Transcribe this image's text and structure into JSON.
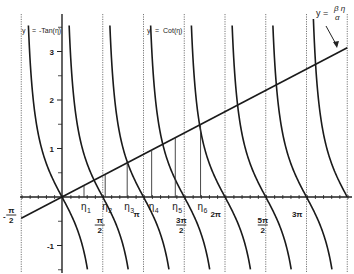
{
  "chart_data": {
    "type": "line",
    "title": "",
    "xlabel": "η",
    "ylabel": "y",
    "xlim_over_pi": [
      -0.5,
      3.5
    ],
    "ylim": [
      -1.55,
      3.8
    ],
    "grid": "dashed vertical lines at multiples of π/2",
    "series": [
      {
        "name": "y = -Tan(η)",
        "function": "-tan",
        "branches_centered_at_over_pi": [
          0,
          1,
          2,
          3
        ]
      },
      {
        "name": "y = Cot(η)",
        "function": "cot",
        "branches_start_over_pi": [
          0,
          1,
          2,
          3
        ]
      },
      {
        "name": "y = βη/α",
        "function": "linear",
        "slope": 0.28,
        "intercept": 0
      }
    ],
    "intersections": [
      {
        "label": "η",
        "sub": "1",
        "x_over_pi": 0.27
      },
      {
        "label": "η",
        "sub": "2",
        "x_over_pi": 0.53
      },
      {
        "label": "η",
        "sub": "3",
        "x_over_pi": 0.8
      },
      {
        "label": "η",
        "sub": "4",
        "x_over_pi": 1.1
      },
      {
        "label": "η",
        "sub": "5",
        "x_over_pi": 1.39
      },
      {
        "label": "η",
        "sub": "6",
        "x_over_pi": 1.7
      }
    ],
    "y_ticks": [
      {
        "value": 3,
        "label": "3"
      },
      {
        "value": 2,
        "label": "2"
      },
      {
        "value": 1,
        "label": "1"
      },
      {
        "value": -1,
        "label": "-1"
      }
    ],
    "y_minor_ticks": [
      3.5,
      2.5,
      1.5,
      0.5,
      -0.5,
      -1.5
    ],
    "x_tick_labels": [
      {
        "over_pi": -0.5,
        "num": "π",
        "den": "2",
        "sign": "-"
      },
      {
        "over_pi": 0.5,
        "num": "π",
        "den": "2",
        "sign": ""
      },
      {
        "over_pi": 1.0,
        "text": "π"
      },
      {
        "over_pi": 1.5,
        "num": "3π",
        "den": "2",
        "sign": ""
      },
      {
        "over_pi": 2.0,
        "text": "2π"
      },
      {
        "over_pi": 2.5,
        "num": "5π",
        "den": "2",
        "sign": ""
      },
      {
        "over_pi": 3.0,
        "text": "3π"
      }
    ],
    "legend": {
      "neg_tan": {
        "y": "y",
        "eq": "=",
        "rhs": "-Tan(η)"
      },
      "cot": {
        "y": "y",
        "eq": "=",
        "rhs": "Cot(η)"
      },
      "line": {
        "lhs": "y =",
        "num": "β η",
        "den": "α"
      }
    }
  }
}
